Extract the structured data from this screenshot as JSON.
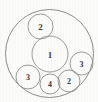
{
  "figure": {
    "background_color": "#fbfbfa",
    "stroke_color": "#8d8d8d",
    "label_color": "#3a3a3a",
    "width": 98,
    "height": 102
  },
  "chart_data": {
    "type": "diagram",
    "subtype": "circle-packing",
    "xlabel": "",
    "ylabel": "",
    "grid": false,
    "legend": null,
    "units": "pixels",
    "xlim": [
      0,
      98
    ],
    "ylim": [
      0,
      102
    ],
    "circles": [
      {
        "id": "outer",
        "label": "",
        "cx": 49.5,
        "cy": 53.5,
        "r": 44.0,
        "role": "bounding-circle"
      },
      {
        "id": "c1",
        "label": "1",
        "cx": 50.0,
        "cy": 54.0,
        "r": 18.0,
        "role": "inner-circle"
      },
      {
        "id": "c2-top",
        "label": "2",
        "cx": 40.5,
        "cy": 26.5,
        "r": 12.5,
        "role": "inner-circle"
      },
      {
        "id": "c3-right",
        "label": "3",
        "cx": 81.5,
        "cy": 63.5,
        "r": 11.5,
        "role": "inner-circle"
      },
      {
        "id": "c2-bottom",
        "label": "2",
        "cx": 69.0,
        "cy": 81.0,
        "r": 11.0,
        "role": "inner-circle"
      },
      {
        "id": "c3-left",
        "label": "3",
        "cx": 28.0,
        "cy": 77.0,
        "r": 12.0,
        "role": "inner-circle"
      },
      {
        "id": "c4-bottom",
        "label": "4",
        "cx": 50.0,
        "cy": 84.0,
        "r": 10.0,
        "role": "inner-circle"
      }
    ],
    "labels": [
      "1",
      "2",
      "3",
      "2",
      "3",
      "4"
    ],
    "values": [
      1,
      2,
      3,
      2,
      3,
      4
    ]
  }
}
